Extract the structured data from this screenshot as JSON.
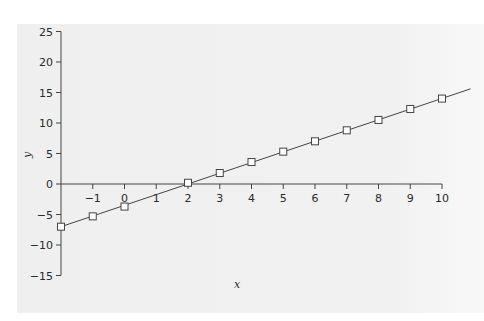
{
  "chart_data": {
    "type": "line",
    "title": "",
    "xlabel": "x",
    "ylabel": "y",
    "xlim": [
      -2,
      10
    ],
    "ylim": [
      -15,
      25
    ],
    "grid": false,
    "x_ticks": [
      -1,
      0,
      1,
      2,
      3,
      4,
      5,
      6,
      7,
      8,
      9,
      10
    ],
    "y_ticks": [
      25,
      20,
      15,
      10,
      5,
      0,
      -5,
      -10,
      -15
    ],
    "line": {
      "name": "fitted line",
      "x": [
        -2,
        10.9
      ],
      "y": [
        -7,
        15.6
      ]
    },
    "series": [
      {
        "name": "data points",
        "marker": "open-square",
        "x": [
          -2,
          -1,
          0,
          2,
          3,
          4,
          5,
          6,
          7,
          8,
          9,
          10
        ],
        "y": [
          -7,
          -5.3,
          -3.7,
          0.2,
          1.8,
          3.6,
          5.3,
          7,
          8.8,
          10.5,
          12.3,
          14
        ]
      }
    ]
  },
  "colors": {
    "panel": "#efefef",
    "axis": "#444444",
    "line": "#444444",
    "marker_fill": "#ffffff"
  }
}
